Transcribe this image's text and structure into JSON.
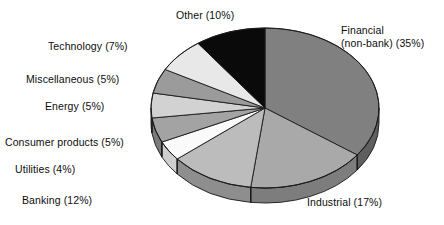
{
  "background": "#ffffff",
  "chart_data": {
    "type": "pie",
    "title": "",
    "subtitle": "",
    "xlabel": "",
    "ylabel": "",
    "legend_position": "none",
    "grid": false,
    "label_format": "{name} ({value}%)",
    "total": 100,
    "start_angle_deg": 0,
    "direction": "clockwise",
    "categories": [
      "Financial (non-bank)",
      "Industrial",
      "Banking",
      "Utilities",
      "Consumer products",
      "Energy",
      "Miscellaneous",
      "Technology",
      "Other"
    ],
    "values": [
      35,
      17,
      12,
      4,
      5,
      5,
      5,
      7,
      10
    ],
    "slices": [
      {
        "name": "Financial (non-bank)",
        "value": 35,
        "label": "Financial\n(non-bank) (35%)",
        "label_line1": "Financial",
        "label_line2": "(non-bank) (35%)",
        "color": "#808080",
        "side_color": "#5f5f5f",
        "label_side": "right",
        "label_x": 341,
        "label_y": 24
      },
      {
        "name": "Industrial",
        "value": 17,
        "label": "Industrial (17%)",
        "color": "#a9a9a9",
        "side_color": "#7d7d7d",
        "label_side": "right",
        "label_x": 307,
        "label_y": 196
      },
      {
        "name": "Banking",
        "value": 12,
        "label": "Banking (12%)",
        "color": "#bcbcbc",
        "side_color": "#8e8e8e",
        "label_side": "left",
        "label_x": 22,
        "label_y": 194
      },
      {
        "name": "Utilities",
        "value": 4,
        "label": "Utilities (4%)",
        "color": "#fafafa",
        "side_color": "#cfcfcf",
        "label_side": "left",
        "label_x": 15,
        "label_y": 163
      },
      {
        "name": "Consumer products",
        "value": 5,
        "label": "Consumer products (5%)",
        "color": "#a3a3a3",
        "side_color": "#7b7b7b",
        "label_side": "left",
        "label_x": 5,
        "label_y": 136
      },
      {
        "name": "Energy",
        "value": 5,
        "label": "Energy (5%)",
        "color": "#d2d2d2",
        "side_color": "#a0a0a0",
        "label_side": "left",
        "label_x": 45,
        "label_y": 100
      },
      {
        "name": "Miscellaneous",
        "value": 5,
        "label": "Miscellaneous (5%)",
        "color": "#9b9b9b",
        "side_color": "#747474",
        "label_side": "left",
        "label_x": 26,
        "label_y": 73
      },
      {
        "name": "Technology",
        "value": 7,
        "label": "Technology (7%)",
        "color": "#e8e8e8",
        "side_color": "#b4b4b4",
        "label_side": "left",
        "label_x": 48,
        "label_y": 40
      },
      {
        "name": "Other",
        "value": 10,
        "label": "Other (10%)",
        "color": "#0a0a0a",
        "side_color": "#000000",
        "label_side": "left",
        "label_x": 176,
        "label_y": 9
      }
    ],
    "geometry": {
      "center_x": 265,
      "center_y": 108,
      "radius_x": 114,
      "radius_y": 80,
      "depth": 15,
      "outline_color": "#1a1a1a",
      "outline_width": 0.9
    }
  },
  "footer": {
    "clipped_caption": "…………………"
  }
}
